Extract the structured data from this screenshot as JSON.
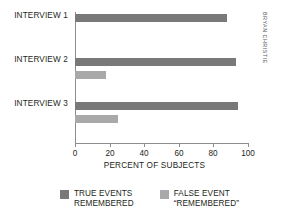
{
  "chart_data": {
    "type": "bar",
    "orientation": "horizontal",
    "title": "",
    "xlabel": "PERCENT OF SUBJECTS",
    "ylabel": "",
    "xlim": [
      0,
      100
    ],
    "xticks": [
      0,
      20,
      40,
      60,
      80,
      100
    ],
    "xtick_labels": [
      "0",
      "20",
      "40",
      "60",
      "80",
      "100"
    ],
    "grid": false,
    "legend_position": "bottom",
    "categories": [
      "INTERVIEW 1",
      "INTERVIEW 2",
      "INTERVIEW 3"
    ],
    "series": [
      {
        "name": "TRUE EVENTS REMEMBERED",
        "color": "#79797a",
        "values": [
          88,
          93,
          94
        ]
      },
      {
        "name": "FALSE EVENT “REMEMBERED”",
        "color": "#a9a9aa",
        "values": [
          0,
          18,
          25
        ]
      }
    ]
  },
  "axis": {
    "x_title": "PERCENT OF SUBJECTS",
    "tick_labels": [
      "0",
      "20",
      "40",
      "60",
      "80",
      "100"
    ],
    "category_labels": [
      "INTERVIEW 1",
      "INTERVIEW 2",
      "INTERVIEW 3"
    ]
  },
  "legend": {
    "items": [
      {
        "line1": "TRUE EVENTS",
        "line2": "REMEMBERED",
        "color": "#79797a"
      },
      {
        "line1": "FALSE EVENT",
        "line2": "“REMEMBERED”",
        "color": "#a9a9aa"
      }
    ]
  },
  "credit": {
    "text": "BRYAN CHRISTIE"
  },
  "colors": {
    "true_bar": "#79797a",
    "false_bar": "#a9a9aa",
    "axis": "#8d8d8d",
    "text": "#231f20",
    "background": "#ffffff"
  }
}
